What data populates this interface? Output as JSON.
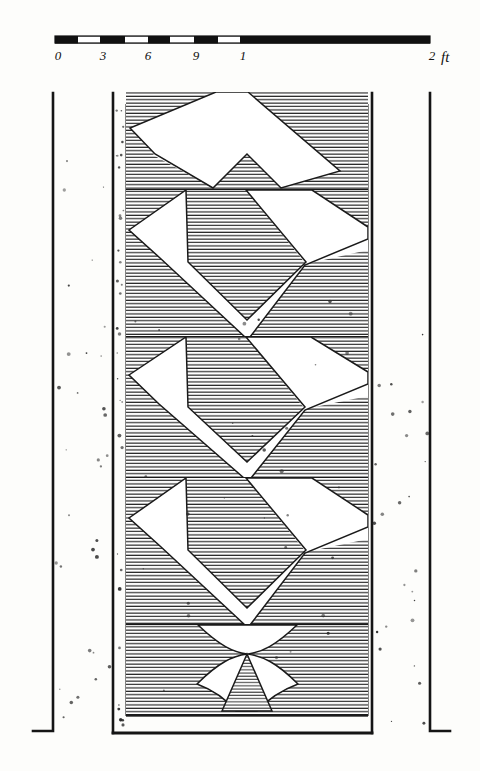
{
  "plate": {
    "kind": "antique-line-engraving",
    "subject": "elevation-of-chevron-carved-masonry-panel",
    "ink_color": "#1a1a1a",
    "paper_color": "#fdfdfb",
    "width": 480,
    "height": 771
  },
  "scale_bar": {
    "name": "graphic-scale",
    "unit_label": "ft",
    "tick_labels": [
      "0",
      "3",
      "6",
      "9",
      "1",
      "2"
    ],
    "tick_x": [
      58,
      103,
      148,
      196,
      243,
      432
    ],
    "bar": {
      "x_start": 55,
      "x_end": 430,
      "y": 36,
      "thickness": 7,
      "segments": [
        {
          "from": 55,
          "to": 78,
          "fill": "black"
        },
        {
          "from": 78,
          "to": 100,
          "fill": "white"
        },
        {
          "from": 100,
          "to": 125,
          "fill": "black"
        },
        {
          "from": 125,
          "to": 148,
          "fill": "white"
        },
        {
          "from": 148,
          "to": 170,
          "fill": "black"
        },
        {
          "from": 170,
          "to": 194,
          "fill": "white"
        },
        {
          "from": 194,
          "to": 218,
          "fill": "black"
        },
        {
          "from": 218,
          "to": 240,
          "fill": "white"
        },
        {
          "from": 240,
          "to": 430,
          "fill": "black"
        }
      ]
    }
  },
  "drawing": {
    "outer_left_wall_x": 53,
    "inner_left_wall_x": 113,
    "panel_left_x": 126,
    "panel_right_x": 368,
    "inner_right_wall_x": 372,
    "outer_right_wall_x": 430,
    "top_y": 92,
    "baseline_y": 733,
    "course_divider_y": [
      190,
      337,
      478,
      625
    ],
    "courses": [
      {
        "index": 1,
        "top": 92,
        "bottom": 190,
        "motif": "half-chevron-open-top"
      },
      {
        "index": 2,
        "top": 190,
        "bottom": 337,
        "motif": "double-zigzag"
      },
      {
        "index": 3,
        "top": 337,
        "bottom": 478,
        "motif": "double-zigzag"
      },
      {
        "index": 4,
        "top": 478,
        "bottom": 625,
        "motif": "double-zigzag"
      },
      {
        "index": 5,
        "top": 625,
        "bottom": 715,
        "motif": "concave-lobes-with-central-spike"
      }
    ],
    "hatch": {
      "spacing": 3.4,
      "stroke": "#262626",
      "stroke_width": 1.0
    },
    "stipple_count": 150
  },
  "annotations": {
    "caption": ""
  }
}
